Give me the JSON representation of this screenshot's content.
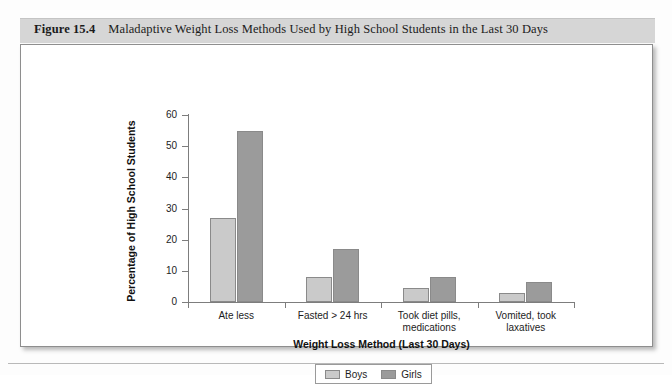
{
  "figure": {
    "number_label": "Figure 15.4",
    "caption": "Maladaptive Weight Loss Methods Used by High School Students in the Last 30 Days"
  },
  "legend": {
    "boys_label": "Boys",
    "girls_label": "Girls"
  },
  "chart_data": {
    "type": "bar",
    "title": "Maladaptive Weight Loss Methods Used by High School Students in the Last 30 Days",
    "xlabel": "Weight Loss Method (Last 30 Days)",
    "ylabel": "Percentage of High School Students",
    "categories": [
      "Ate less",
      "Fasted > 24 hrs",
      "Took diet pills,\nmedications",
      "Vomited, took\nlaxatives"
    ],
    "category_lines": [
      [
        "Ate less"
      ],
      [
        "Fasted > 24 hrs"
      ],
      [
        "Took diet pills,",
        "medications"
      ],
      [
        "Vomited, took",
        "laxatives"
      ]
    ],
    "series": [
      {
        "name": "Boys",
        "color": "#cacaca",
        "values": [
          27,
          8,
          4.5,
          3
        ]
      },
      {
        "name": "Girls",
        "color": "#9b9b9b",
        "values": [
          55,
          17,
          8,
          6.5
        ]
      }
    ],
    "ylim": [
      0,
      60
    ],
    "yticks": [
      0,
      10,
      20,
      30,
      40,
      50,
      60
    ],
    "ytick_labels": [
      "0",
      "10",
      "20",
      "30",
      "40",
      "50",
      "60"
    ],
    "grid": false,
    "legend_position": "bottom"
  }
}
